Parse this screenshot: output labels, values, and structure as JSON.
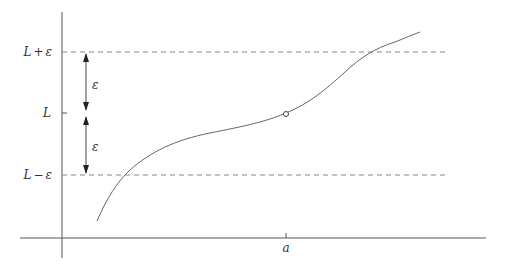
{
  "diagram": {
    "title": "",
    "colors": {
      "axis": "#555555",
      "curve": "#666666",
      "dashed": "#888888",
      "text": "#333333",
      "background": "#ffffff"
    },
    "y_labels": {
      "upper": {
        "main": "L",
        "op": "+",
        "eps": "ε"
      },
      "middle": {
        "main": "L"
      },
      "lower": {
        "main": "L",
        "op": "−",
        "eps": "ε"
      }
    },
    "x_labels": {
      "a": "a"
    },
    "arrow_labels": {
      "upper_eps": "ε",
      "lower_eps": "ε"
    },
    "markers": {
      "hole": {
        "label": "open circle at (a, L)"
      }
    }
  }
}
